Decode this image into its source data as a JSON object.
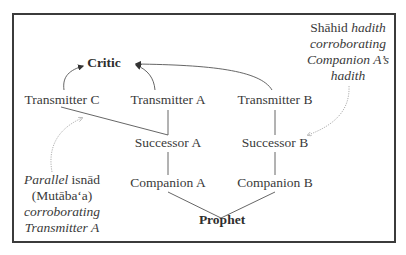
{
  "nodes": {
    "critic": "Critic",
    "transmitter_c": "Transmitter C",
    "transmitter_a": "Transmitter A",
    "transmitter_b": "Transmitter B",
    "successor_a": "Successor A",
    "successor_b": "Successor B",
    "companion_a": "Companion A",
    "companion_b": "Companion B",
    "prophet": "Prophet"
  },
  "notes": {
    "shahid": {
      "line1_plain": "Shāhid",
      "line1_italic": "hadith",
      "line2": "corroborating",
      "line3": "Companion A’s",
      "line4": "hadith"
    },
    "parallel": {
      "line1_italic": "Parallel",
      "line1_plain": "isnād",
      "line2": "(Mutāba‘a)",
      "line3": "corroborating",
      "line4": "Transmitter A"
    }
  },
  "colors": {
    "frame": "#3b3b3b",
    "text": "#3a3a3a",
    "line": "#4a4a4a",
    "dotted": "#9a9a9a"
  }
}
